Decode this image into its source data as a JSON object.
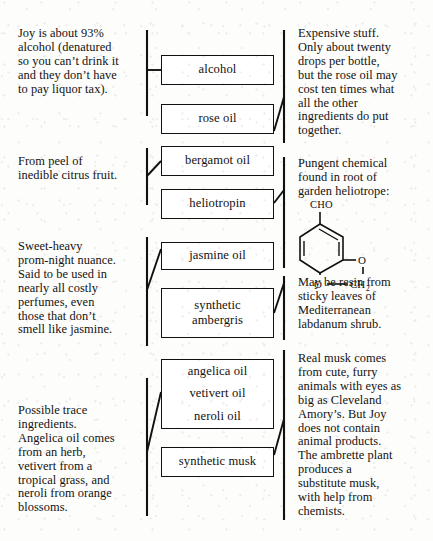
{
  "diagram": {
    "ink_color": "#111111",
    "paper_color": "#fdfdfc"
  },
  "boxes": [
    {
      "id": "alcohol",
      "label": "alcohol"
    },
    {
      "id": "rose-oil",
      "label": "rose oil"
    },
    {
      "id": "bergamot-oil",
      "label": "bergamot oil"
    },
    {
      "id": "heliotropin",
      "label": "heliotropin"
    },
    {
      "id": "jasmine-oil",
      "label": "jasmine oil"
    },
    {
      "id": "synthetic-ambergris",
      "line1": "synthetic",
      "line2": "ambergris"
    },
    {
      "id": "trace-oils",
      "line1": "angelica oil",
      "line2": "vetivert oil",
      "line3": "neroli oil"
    },
    {
      "id": "synthetic-musk",
      "label": "synthetic musk"
    }
  ],
  "left_notes": [
    {
      "id": "alcohol-note",
      "text": "Joy is about 93%\nalcohol (denatured\nso you can’t drink it\nand they don’t have\nto pay liquor tax)."
    },
    {
      "id": "bergamot-note",
      "text": "From peel of\ninedible citrus fruit."
    },
    {
      "id": "jasmine-note",
      "text": "Sweet-heavy\nprom-night nuance.\nSaid to be used in\nnearly all costly\nperfumes, even\nthose that don’t\nsmell like jasmine."
    },
    {
      "id": "trace-note",
      "text": "Possible trace\ningredients.\nAngelica oil comes\nfrom an herb,\nvetivert from a\ntropical grass, and\nneroli from orange\nblossoms."
    }
  ],
  "right_notes": [
    {
      "id": "rose-oil-note",
      "text": "Expensive stuff.\nOnly about twenty\ndrops per bottle,\nbut the rose oil may\ncost ten times what\nall the other\ningredients do put\ntogether."
    },
    {
      "id": "heliotropin-note",
      "text": "Pungent chemical\nfound in root of\ngarden heliotrope:"
    },
    {
      "id": "ambergris-note",
      "text": "May be resin from\nsticky leaves of\nMediterranean\nlabdanum shrub."
    },
    {
      "id": "musk-note",
      "text": "Real musk comes\nfrom cute, furry\nanimals with eyes as\nbig as Cleveland\nAmory’s. But Joy\ndoes not contain\nanimal products.\nThe ambrette plant\nproduces a\nsubstitute musk,\nwith help from\nchemists."
    }
  ],
  "chemical_structure": {
    "id": "heliotropin-structure",
    "name": "heliotropin (piperonal) skeletal formula",
    "labels": {
      "aldehyde": "CHO",
      "oxygen_upper": "O",
      "oxygen_lower": "O",
      "methylene": "CH",
      "methylene_subscript": "2"
    }
  }
}
